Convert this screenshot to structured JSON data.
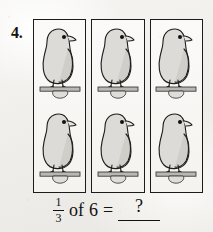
{
  "worksheet": {
    "problem_number": "4.",
    "background_color": "#f2f1ee",
    "ink_color": "#1c1c1c"
  },
  "groups": [
    {
      "label": "group-1",
      "items": [
        {
          "icon": "bird-icon",
          "alt": "bird perched on branch"
        },
        {
          "icon": "bird-icon",
          "alt": "bird perched on branch"
        }
      ]
    },
    {
      "label": "group-2",
      "items": [
        {
          "icon": "bird-icon",
          "alt": "bird perched on branch"
        },
        {
          "icon": "bird-icon",
          "alt": "bird perched on branch"
        }
      ]
    },
    {
      "label": "group-3",
      "items": [
        {
          "icon": "bird-icon",
          "alt": "bird perched on branch"
        },
        {
          "icon": "bird-icon",
          "alt": "bird perched on branch"
        }
      ]
    }
  ],
  "equation": {
    "fraction_numerator": "1",
    "fraction_denominator": "3",
    "of_word": "of",
    "whole_number": "6",
    "equals_sign": "=",
    "answer_placeholder": "?"
  }
}
